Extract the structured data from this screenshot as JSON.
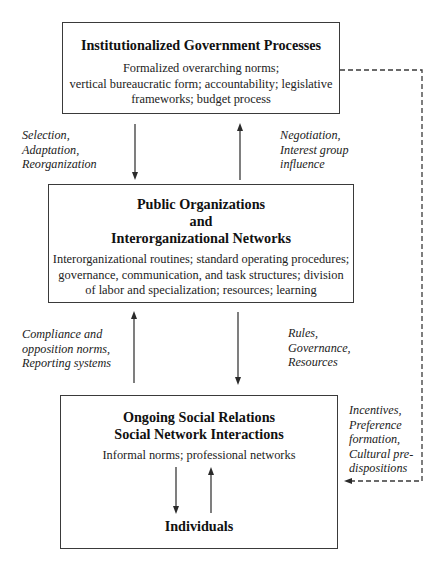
{
  "diagram": {
    "boxes": {
      "institutional": {
        "title": "Institutionalized Government Processes",
        "description_lines": [
          "Formalized overarching norms;",
          "vertical bureaucratic form; accountability; legislative",
          "frameworks; budget process"
        ]
      },
      "organizations": {
        "title_lines": [
          "Public Organizations",
          "and",
          "Interorganizational Networks"
        ],
        "description_lines": [
          "Interorganizational routines; standard operating procedures;",
          "governance, communication, and task structures; division",
          "of labor and specialization; resources; learning"
        ]
      },
      "social": {
        "title_lines": [
          "Ongoing Social Relations",
          "Social Network Interactions"
        ],
        "description": "Informal norms; professional networks",
        "inner_node": "Individuals"
      }
    },
    "edge_labels": {
      "selection": [
        "Selection,",
        "Adaptation,",
        "Reorganization"
      ],
      "negotiation": [
        "Negotiation,",
        "Interest group",
        "influence"
      ],
      "compliance": [
        "Compliance and",
        "opposition norms,",
        "Reporting systems"
      ],
      "rules": [
        "Rules,",
        "Governance,",
        "Resources"
      ],
      "incentives": [
        "Incentives,",
        "Preference",
        "formation,",
        "Cultural pre-",
        "dispositions"
      ]
    },
    "edges": [
      {
        "from": "institutional",
        "to": "organizations",
        "style": "solid",
        "label": "selection"
      },
      {
        "from": "organizations",
        "to": "institutional",
        "style": "solid",
        "label": "negotiation"
      },
      {
        "from": "social",
        "to": "organizations",
        "style": "solid",
        "label": "compliance"
      },
      {
        "from": "organizations",
        "to": "social",
        "style": "solid",
        "label": "rules"
      },
      {
        "from": "institutional",
        "to": "social",
        "style": "dashed",
        "label": "incentives"
      },
      {
        "from": "social",
        "to": "individuals",
        "style": "solid"
      },
      {
        "from": "individuals",
        "to": "social",
        "style": "solid"
      }
    ],
    "colors": {
      "stroke": "#3a3a3a",
      "text": "#1a1a1a",
      "background": "#ffffff"
    }
  }
}
